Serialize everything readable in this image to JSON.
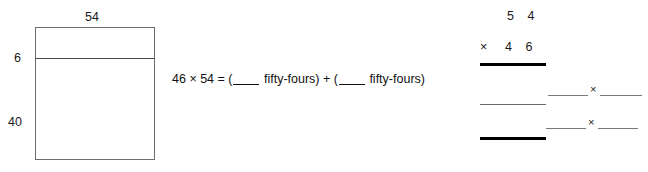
{
  "area_model": {
    "top_label": "54",
    "left_label_upper": "6",
    "left_label_lower": "40"
  },
  "equation": {
    "left_side": "46 × 54 = (",
    "blank_1": "",
    "term_1": " fifty-fours) + (",
    "blank_2": "",
    "term_2": " fifty-fours)"
  },
  "algorithm": {
    "multiplicand": "5 4",
    "operator": "×",
    "multiplier": "4 6",
    "factor_rows": [
      {
        "times_symbol": "×"
      },
      {
        "times_symbol": "×"
      }
    ]
  }
}
